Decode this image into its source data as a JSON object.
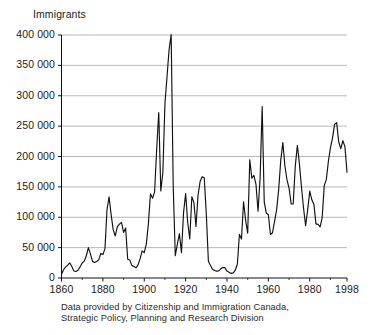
{
  "chart_data": {
    "type": "line",
    "title": "",
    "ylabel": "Immigrants",
    "xlabel": "",
    "ylim": [
      0,
      400000
    ],
    "xlim": [
      1860,
      1998
    ],
    "grid": true,
    "legend": "none",
    "ytick_labels": [
      "400 000",
      "350 000",
      "300 000",
      "250 000",
      "200 000",
      "150 000",
      "100 000",
      "50 000",
      "0"
    ],
    "ytick_values": [
      400000,
      350000,
      300000,
      250000,
      200000,
      150000,
      100000,
      50000,
      0
    ],
    "xtick_labels": [
      "1860",
      "1880",
      "1900",
      "1920",
      "1940",
      "1960",
      "1980",
      "1998"
    ],
    "xtick_values": [
      1860,
      1880,
      1900,
      1920,
      1940,
      1960,
      1980,
      1998
    ],
    "xminor_values": [
      1870,
      1890,
      1910,
      1930,
      1950,
      1970,
      1990
    ],
    "series": [
      {
        "name": "Immigrants to Canada",
        "color": "#111111",
        "x": [
          1860,
          1861,
          1862,
          1863,
          1864,
          1865,
          1866,
          1867,
          1868,
          1869,
          1870,
          1871,
          1872,
          1873,
          1874,
          1875,
          1876,
          1877,
          1878,
          1879,
          1880,
          1881,
          1882,
          1883,
          1884,
          1885,
          1886,
          1887,
          1888,
          1889,
          1890,
          1891,
          1892,
          1893,
          1894,
          1895,
          1896,
          1897,
          1898,
          1899,
          1900,
          1901,
          1902,
          1903,
          1904,
          1905,
          1906,
          1907,
          1908,
          1909,
          1910,
          1911,
          1912,
          1913,
          1914,
          1915,
          1916,
          1917,
          1918,
          1919,
          1920,
          1921,
          1922,
          1923,
          1924,
          1925,
          1926,
          1927,
          1928,
          1929,
          1930,
          1931,
          1932,
          1933,
          1934,
          1935,
          1936,
          1937,
          1938,
          1939,
          1940,
          1941,
          1942,
          1943,
          1944,
          1945,
          1946,
          1947,
          1948,
          1949,
          1950,
          1951,
          1952,
          1953,
          1954,
          1955,
          1956,
          1957,
          1958,
          1959,
          1960,
          1961,
          1962,
          1963,
          1964,
          1965,
          1966,
          1967,
          1968,
          1969,
          1970,
          1971,
          1972,
          1973,
          1974,
          1975,
          1976,
          1977,
          1978,
          1979,
          1980,
          1981,
          1982,
          1983,
          1984,
          1985,
          1986,
          1987,
          1988,
          1989,
          1990,
          1991,
          1992,
          1993,
          1994,
          1995,
          1996,
          1997,
          1998
        ],
        "values": [
          6300,
          13600,
          18300,
          21000,
          24800,
          18958,
          11427,
          10666,
          12765,
          18630,
          24706,
          27773,
          36578,
          50050,
          39373,
          27382,
          25633,
          27082,
          29807,
          40492,
          38505,
          47991,
          112458,
          133624,
          103824,
          79169,
          69152,
          84526,
          88766,
          91600,
          75067,
          82165,
          30996,
          29633,
          20829,
          18790,
          16835,
          21716,
          31900,
          44543,
          41681,
          55747,
          89102,
          138660,
          131252,
          141465,
          211653,
          272409,
          143326,
          173694,
          286839,
          331288,
          375756,
          400870,
          150484,
          36665,
          55914,
          72910,
          41845,
          107698,
          138824,
          91728,
          64224,
          133729,
          124164,
          84907,
          135982,
          158886,
          166783,
          164993,
          104806,
          27530,
          20591,
          14382,
          12476,
          11277,
          11643,
          15101,
          17244,
          16994,
          11324,
          9329,
          7576,
          8504,
          12801,
          22722,
          71719,
          64127,
          125414,
          95217,
          73912,
          194391,
          164498,
          168868,
          154227,
          109946,
          164857,
          282164,
          124851,
          106928,
          104111,
          71689,
          74586,
          93151,
          112606,
          146758,
          194743,
          222876,
          183974,
          161531,
          147713,
          121900,
          122006,
          184200,
          218465,
          187881,
          149429,
          114914,
          86313,
          112096,
          143117,
          128618,
          121147,
          89157,
          88239,
          84302,
          99219,
          152098,
          161929,
          192001,
          214230,
          230781,
          252842,
          255819,
          223875,
          212859,
          226039,
          216014,
          174100
        ]
      }
    ],
    "caption_line1": "Data provided by Citizenship and Immigration Canada,",
    "caption_line2": "Strategic Policy, Planning and Research Division"
  }
}
